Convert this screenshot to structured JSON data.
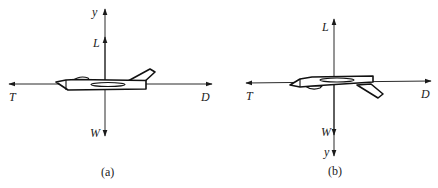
{
  "figure": {
    "panels": [
      {
        "id": "a",
        "caption": "(a)",
        "labels": {
          "y": "y",
          "lift": "L",
          "thrust": "T",
          "drag": "D",
          "weight": "W"
        },
        "y_axis_direction": "up",
        "aircraft_orientation": "upright"
      },
      {
        "id": "b",
        "caption": "(b)",
        "labels": {
          "y": "y",
          "lift": "L",
          "thrust": "T",
          "drag": "D",
          "weight": "W"
        },
        "y_axis_direction": "down",
        "aircraft_orientation": "inverted"
      }
    ],
    "colors": {
      "lines": "#2a2a2a",
      "text": "#222222",
      "background": "#ffffff"
    }
  }
}
